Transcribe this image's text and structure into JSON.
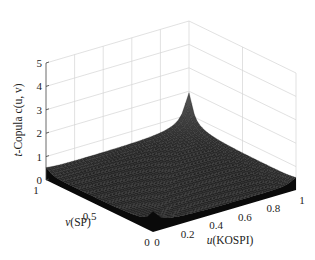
{
  "chart_data": {
    "type": "surface3d",
    "title": "",
    "zlabel": "t-Copula c(u, v)",
    "xlabel": "u(KOSPI)",
    "ylabel": "v(SP)",
    "x_ticks": [
      "0",
      "0.2",
      "0.4",
      "0.6",
      "0.8",
      "1"
    ],
    "y_ticks": [
      "0",
      "0.5",
      "1"
    ],
    "z_ticks": [
      "0",
      "1",
      "2",
      "3",
      "4",
      "5"
    ],
    "xlim": [
      0,
      1
    ],
    "ylim": [
      0,
      1
    ],
    "zlim": [
      0,
      5
    ],
    "grid": true,
    "colormap": "gray",
    "peaks": [
      {
        "u": 1,
        "v": 1,
        "z": 4.7
      },
      {
        "u": 0,
        "v": 0,
        "z": 2.0
      }
    ],
    "grid_resolution": 40
  },
  "labels": {
    "zlabel_prefix": "t",
    "zlabel_rest": "-Copula c(u, v)",
    "xlabel": "u(KOSPI)",
    "ylabel": "v(SP)"
  }
}
